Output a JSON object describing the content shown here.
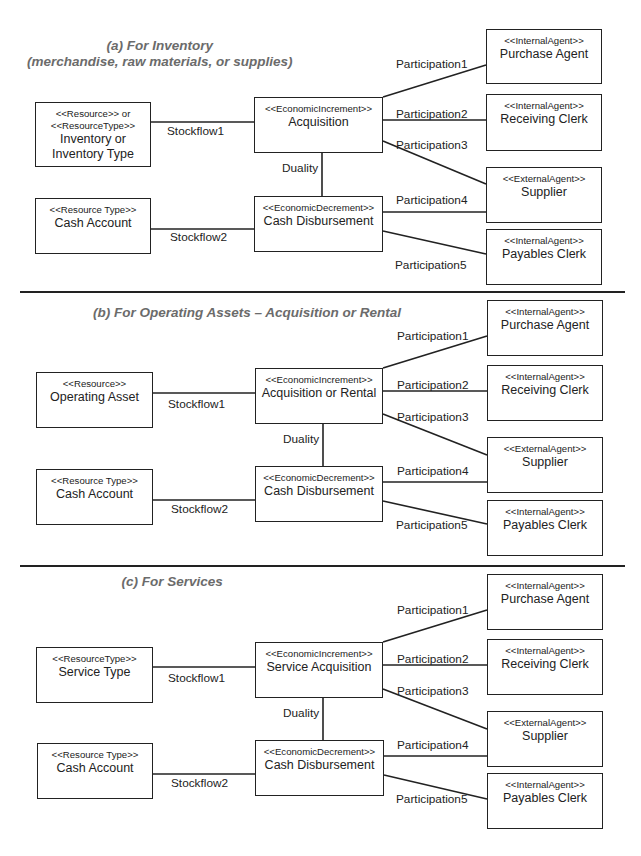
{
  "diagram": {
    "top_rule": {
      "y": 0,
      "x1": 20,
      "x2": 625
    },
    "sections": [
      {
        "id": "a",
        "title_lines": [
          "(a)  For Inventory",
          "(merchandise, raw materials, or supplies)"
        ],
        "title_pos": {
          "cx": 160,
          "y": 38
        },
        "boxes": {
          "resource": {
            "stereotype": "<<Resource>>  or\n<<ResourceType>>",
            "name": "Inventory or\nInventory Type",
            "x": 35,
            "y": 102,
            "w": 116,
            "h": 65
          },
          "increment": {
            "stereotype": "<<EconomicIncrement>>",
            "name": "Acquisition",
            "x": 254,
            "y": 97,
            "w": 129,
            "h": 56
          },
          "cash": {
            "stereotype": "<<Resource Type>>",
            "name": "Cash Account",
            "x": 35,
            "y": 198,
            "w": 116,
            "h": 56
          },
          "decrement": {
            "stereotype": "<<EconomicDecrement>>",
            "name": "Cash Disbursement",
            "x": 254,
            "y": 196,
            "w": 129,
            "h": 56
          },
          "purchase_agent": {
            "stereotype": "<<InternalAgent>>",
            "name": "Purchase Agent",
            "x": 486,
            "y": 29,
            "w": 116,
            "h": 55
          },
          "receiving_clerk": {
            "stereotype": "<<InternalAgent>>",
            "name": "Receiving Clerk",
            "x": 486,
            "y": 94,
            "w": 116,
            "h": 57
          },
          "supplier": {
            "stereotype": "<<ExternalAgent>>",
            "name": "Supplier",
            "x": 486,
            "y": 167,
            "w": 116,
            "h": 56
          },
          "payables_clerk": {
            "stereotype": "<<InternalAgent>>",
            "name": "Payables Clerk",
            "x": 486,
            "y": 229,
            "w": 116,
            "h": 56
          }
        },
        "lines": [
          {
            "x1": 151,
            "y1": 122,
            "x2": 254,
            "y2": 122
          },
          {
            "x1": 151,
            "y1": 229,
            "x2": 254,
            "y2": 229
          },
          {
            "x1": 322,
            "y1": 153,
            "x2": 322,
            "y2": 196
          },
          {
            "x1": 383,
            "y1": 97,
            "x2": 486,
            "y2": 65
          },
          {
            "x1": 383,
            "y1": 120,
            "x2": 486,
            "y2": 120
          },
          {
            "x1": 383,
            "y1": 141,
            "x2": 486,
            "y2": 184
          },
          {
            "x1": 383,
            "y1": 212,
            "x2": 486,
            "y2": 212
          },
          {
            "x1": 383,
            "y1": 231,
            "x2": 486,
            "y2": 254
          }
        ],
        "labels": [
          {
            "text": "Stockflow1",
            "x": 167,
            "y": 124
          },
          {
            "text": "Stockflow2",
            "x": 170,
            "y": 230
          },
          {
            "text": "Duality",
            "x": 282,
            "y": 161
          },
          {
            "text": "Participation1",
            "x": 396,
            "y": 57
          },
          {
            "text": "Participation2",
            "x": 396,
            "y": 107
          },
          {
            "text": "Participation3",
            "x": 396,
            "y": 138
          },
          {
            "text": "Participation4",
            "x": 396,
            "y": 193
          },
          {
            "text": "Participation5",
            "x": 395,
            "y": 258
          }
        ],
        "separator": {
          "y": 291,
          "x1": 20,
          "x2": 625
        }
      },
      {
        "id": "b",
        "title_lines": [
          "(b) For Operating Assets – Acquisition or Rental"
        ],
        "title_pos": {
          "cx": 247,
          "y": 305
        },
        "boxes": {
          "resource": {
            "stereotype": "<<Resource>>",
            "name": "Operating Asset",
            "x": 36,
            "y": 372,
            "w": 117,
            "h": 56
          },
          "increment": {
            "stereotype": "<<EconomicIncrement>>",
            "name": "Acquisition or Rental",
            "x": 255,
            "y": 368,
            "w": 128,
            "h": 56
          },
          "cash": {
            "stereotype": "<<Resource Type>>",
            "name": "Cash Account",
            "x": 36,
            "y": 469,
            "w": 117,
            "h": 56
          },
          "decrement": {
            "stereotype": "<<EconomicDecrement>>",
            "name": "Cash Disbursement",
            "x": 255,
            "y": 466,
            "w": 128,
            "h": 56
          },
          "purchase_agent": {
            "stereotype": "<<InternalAgent>>",
            "name": "Purchase Agent",
            "x": 487,
            "y": 300,
            "w": 116,
            "h": 56
          },
          "receiving_clerk": {
            "stereotype": "<<InternalAgent>>",
            "name": "Receiving Clerk",
            "x": 487,
            "y": 365,
            "w": 116,
            "h": 56
          },
          "supplier": {
            "stereotype": "<<ExternalAgent>>",
            "name": "Supplier",
            "x": 487,
            "y": 437,
            "w": 116,
            "h": 56
          },
          "payables_clerk": {
            "stereotype": "<<InternalAgent>>",
            "name": "Payables Clerk",
            "x": 487,
            "y": 500,
            "w": 116,
            "h": 56
          }
        },
        "lines": [
          {
            "x1": 153,
            "y1": 393,
            "x2": 255,
            "y2": 393
          },
          {
            "x1": 153,
            "y1": 500,
            "x2": 255,
            "y2": 500
          },
          {
            "x1": 323,
            "y1": 424,
            "x2": 323,
            "y2": 466
          },
          {
            "x1": 383,
            "y1": 368,
            "x2": 487,
            "y2": 336
          },
          {
            "x1": 383,
            "y1": 391,
            "x2": 487,
            "y2": 391
          },
          {
            "x1": 383,
            "y1": 414,
            "x2": 487,
            "y2": 455
          },
          {
            "x1": 383,
            "y1": 482,
            "x2": 487,
            "y2": 482
          },
          {
            "x1": 383,
            "y1": 501,
            "x2": 487,
            "y2": 524
          }
        ],
        "labels": [
          {
            "text": "Stockflow1",
            "x": 168,
            "y": 397
          },
          {
            "text": "Stockflow2",
            "x": 171,
            "y": 502
          },
          {
            "text": "Duality",
            "x": 283,
            "y": 432
          },
          {
            "text": "Participation1",
            "x": 397,
            "y": 329
          },
          {
            "text": "Participation2",
            "x": 397,
            "y": 378
          },
          {
            "text": "Participation3",
            "x": 397,
            "y": 410
          },
          {
            "text": "Participation4",
            "x": 397,
            "y": 464
          },
          {
            "text": "Participation5",
            "x": 396,
            "y": 518
          }
        ],
        "separator": {
          "y": 565,
          "x1": 20,
          "x2": 625
        }
      },
      {
        "id": "c",
        "title_lines": [
          "(c) For Services"
        ],
        "title_pos": {
          "cx": 172,
          "y": 574
        },
        "boxes": {
          "resource": {
            "stereotype": "<<ResourceType>>",
            "name": "Service Type",
            "x": 36,
            "y": 647,
            "w": 117,
            "h": 56
          },
          "increment": {
            "stereotype": "<<EconomicIncrement>>",
            "name": "Service Acquisition",
            "x": 255,
            "y": 642,
            "w": 128,
            "h": 56
          },
          "cash": {
            "stereotype": "<<Resource Type>>",
            "name": "Cash Account",
            "x": 37,
            "y": 743,
            "w": 116,
            "h": 56
          },
          "decrement": {
            "stereotype": "<<EconomicDecrement>>",
            "name": "Cash Disbursement",
            "x": 255,
            "y": 740,
            "w": 129,
            "h": 56
          },
          "purchase_agent": {
            "stereotype": "<<InternalAgent>>",
            "name": "Purchase Agent",
            "x": 487,
            "y": 574,
            "w": 116,
            "h": 56
          },
          "receiving_clerk": {
            "stereotype": "<<InternalAgent>>",
            "name": "Receiving Clerk",
            "x": 487,
            "y": 639,
            "w": 116,
            "h": 56
          },
          "supplier": {
            "stereotype": "<<ExternalAgent>>",
            "name": "Supplier",
            "x": 487,
            "y": 711,
            "w": 116,
            "h": 56
          },
          "payables_clerk": {
            "stereotype": "<<InternalAgent>>",
            "name": "Payables Clerk",
            "x": 487,
            "y": 773,
            "w": 116,
            "h": 56
          }
        },
        "lines": [
          {
            "x1": 153,
            "y1": 667,
            "x2": 255,
            "y2": 667
          },
          {
            "x1": 153,
            "y1": 774,
            "x2": 255,
            "y2": 774
          },
          {
            "x1": 323,
            "y1": 698,
            "x2": 323,
            "y2": 740
          },
          {
            "x1": 383,
            "y1": 642,
            "x2": 487,
            "y2": 610
          },
          {
            "x1": 383,
            "y1": 665,
            "x2": 487,
            "y2": 665
          },
          {
            "x1": 383,
            "y1": 689,
            "x2": 487,
            "y2": 729
          },
          {
            "x1": 384,
            "y1": 756,
            "x2": 487,
            "y2": 756
          },
          {
            "x1": 384,
            "y1": 775,
            "x2": 487,
            "y2": 799
          }
        ],
        "labels": [
          {
            "text": "Stockflow1",
            "x": 168,
            "y": 671
          },
          {
            "text": "Stockflow2",
            "x": 171,
            "y": 776
          },
          {
            "text": "Duality",
            "x": 283,
            "y": 706
          },
          {
            "text": "Participation1",
            "x": 397,
            "y": 603
          },
          {
            "text": "Participation2",
            "x": 397,
            "y": 652
          },
          {
            "text": "Participation3",
            "x": 397,
            "y": 684
          },
          {
            "text": "Participation4",
            "x": 397,
            "y": 738
          },
          {
            "text": "Participation5",
            "x": 396,
            "y": 792
          }
        ],
        "separator": null
      }
    ]
  }
}
